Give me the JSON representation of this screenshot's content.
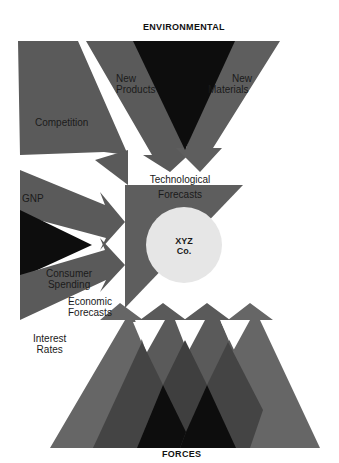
{
  "diagram": {
    "title_top": "ENVIRONMENTAL",
    "title_bottom": "FORCES",
    "center_entity": {
      "line1": "XYZ",
      "line2": "Co."
    },
    "labels": {
      "competition": "Competition",
      "new_products_1": "New",
      "new_products_2": "Products",
      "new_materials_1": "New",
      "new_materials_2": "Materials",
      "technological_1": "Technological",
      "technological_2": "Forecasts",
      "gnp": "GNP",
      "consumer_1": "Consumer",
      "consumer_2": "Spending",
      "economic_1": "Economic",
      "economic_2": "Forecasts",
      "interest_1": "Interest",
      "interest_2": "Rates"
    },
    "colors": {
      "dark_gray": "#555555",
      "mid_gray": "#606060",
      "black": "#0d0d0d",
      "overlap_dark": "#3a3a3a",
      "circle_fill": "#e6e6e6",
      "background": "#ffffff"
    }
  }
}
